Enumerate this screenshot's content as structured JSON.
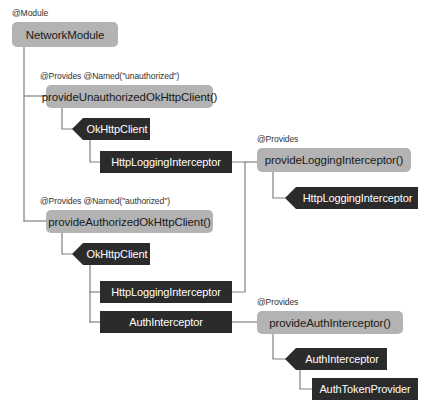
{
  "diagram": {
    "canvas": {
      "width": 429,
      "height": 415
    },
    "colors": {
      "background": "#ffffff",
      "provider_node": "#b3b3b3",
      "provider_node_text": "#1a1a1a",
      "dependency_node": "#2b2b2b",
      "dependency_node_text": "#ffffff",
      "wire": "#808080",
      "annotation_text": "#333333"
    },
    "annotations": [
      {
        "id": "ann-module",
        "text": "@Module"
      },
      {
        "id": "ann-unauthorized",
        "text": "@Provides @Named(\"unauthorized\")"
      },
      {
        "id": "ann-authorized",
        "text": "@Provides @Named(\"authorized\")"
      },
      {
        "id": "ann-provides-logging",
        "text": "@Provides"
      },
      {
        "id": "ann-provides-auth",
        "text": "@Provides"
      }
    ],
    "nodes": [
      {
        "id": "network-module",
        "label": "NetworkModule",
        "kind": "module"
      },
      {
        "id": "provide-unauthorized-okhttpclient",
        "label": "provideUnauthorizedOkHttpClient()",
        "kind": "provider"
      },
      {
        "id": "okhttpclient-unauthorized",
        "label": "OkHttpClient",
        "kind": "dependency"
      },
      {
        "id": "httplogginginterceptor-unauthorized",
        "label": "HttpLoggingInterceptor",
        "kind": "dependency"
      },
      {
        "id": "provide-logging-interceptor",
        "label": "provideLoggingInterceptor()",
        "kind": "provider"
      },
      {
        "id": "httplogginginterceptor-provided",
        "label": "HttpLoggingInterceptor",
        "kind": "dependency"
      },
      {
        "id": "provide-authorized-okhttpclient",
        "label": "provideAuthorizedOkHttpClient()",
        "kind": "provider"
      },
      {
        "id": "okhttpclient-authorized",
        "label": "OkHttpClient",
        "kind": "dependency"
      },
      {
        "id": "httplogginginterceptor-authorized",
        "label": "HttpLoggingInterceptor",
        "kind": "dependency"
      },
      {
        "id": "authinterceptor-authorized",
        "label": "AuthInterceptor",
        "kind": "dependency"
      },
      {
        "id": "provide-auth-interceptor",
        "label": "provideAuthInterceptor()",
        "kind": "provider"
      },
      {
        "id": "authinterceptor-provided",
        "label": "AuthInterceptor",
        "kind": "dependency"
      },
      {
        "id": "authtokenprovider",
        "label": "AuthTokenProvider",
        "kind": "dependency"
      }
    ]
  }
}
